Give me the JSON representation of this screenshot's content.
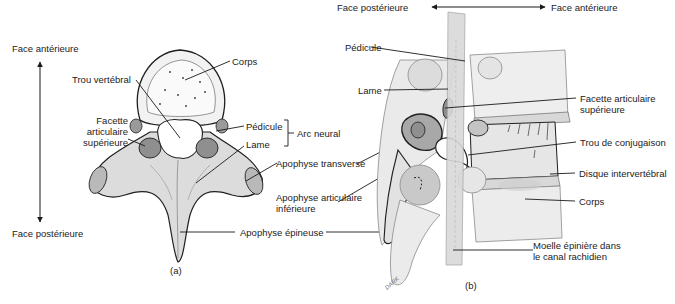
{
  "figure_a": {
    "caption": "(a)",
    "orientation": {
      "top": "Face antérieure",
      "bottom": "Face postérieure"
    },
    "labels": {
      "corps": "Corps",
      "trou_vertebral": "Trou vertébral",
      "facette_line1": "Facette",
      "facette_line2": "articulaire",
      "facette_line3": "supérieure",
      "pedicule": "Pédicule",
      "lame": "Lame",
      "arc_neural": "Arc neural",
      "apophyse_transverse": "Apophyse transverse",
      "apophyse_articulaire_line1": "Apophyse articulaire",
      "apophyse_articulaire_line2": "inférieure",
      "apophyse_epineuse": "Apophyse épineuse"
    }
  },
  "figure_b": {
    "caption": "(b)",
    "orientation": {
      "left": "Face postérieure",
      "right": "Face antérieure"
    },
    "labels": {
      "pedicule": "Pédicule",
      "lame": "Lame",
      "facette_line1": "Facette articulaire",
      "facette_line2": "supérieure",
      "trou_conjugaison": "Trou de conjugaison",
      "disque": "Disque intervertébral",
      "corps": "Corps",
      "moelle_line1": "Moelle épinière dans",
      "moelle_line2": "le canal rachidien"
    },
    "signature": "DARK"
  },
  "colors": {
    "bone_fill": "#e9e9e9",
    "bone_shade": "#b9b9b9",
    "facet_fill": "#8f8f8f",
    "outline": "#1f1f1f",
    "leader": "#1a1a1a"
  }
}
